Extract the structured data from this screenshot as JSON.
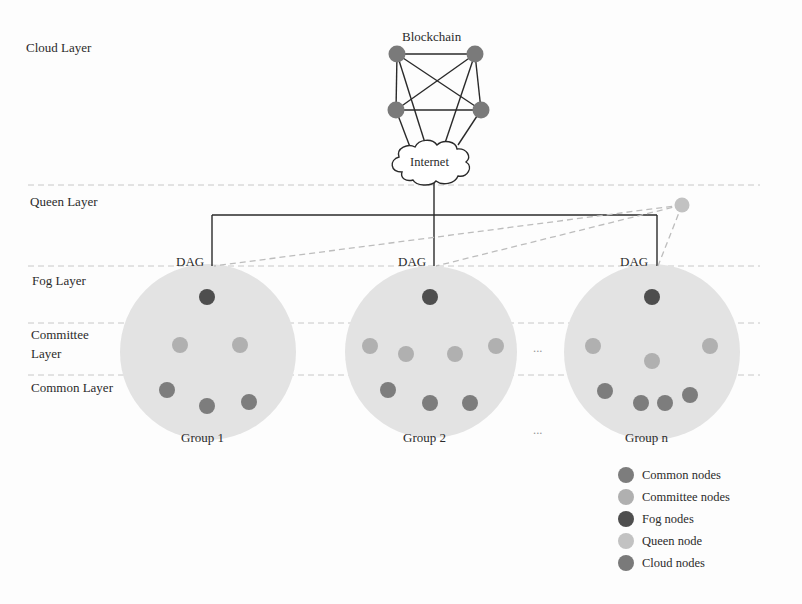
{
  "layers": {
    "cloud": "Cloud Layer",
    "queen": "Queen Layer",
    "fog": "Fog Layer",
    "committee_line1": "Committee",
    "committee_line2": "Layer",
    "common": "Common Layer"
  },
  "cloud": {
    "blockchain_label": "Blockchain",
    "internet_label": "Internet"
  },
  "dag_label": "DAG",
  "groups": [
    {
      "label": "Group 1"
    },
    {
      "label": "Group 2"
    },
    {
      "label": "Group n"
    }
  ],
  "ellipsis": "...",
  "legend": [
    {
      "label": "Common nodes",
      "color": "#7d7d7d"
    },
    {
      "label": "Committee nodes",
      "color": "#b0b0b0"
    },
    {
      "label": "Fog nodes",
      "color": "#4e4e4e"
    },
    {
      "label": "Queen node",
      "color": "#c2c2c2"
    },
    {
      "label": "Cloud nodes",
      "color": "#7a7a7a"
    }
  ],
  "colors": {
    "group_fill": "#e3e3e3",
    "common": "#7d7d7d",
    "committee": "#b0b0b0",
    "fog": "#4e4e4e",
    "queen": "#c2c2c2",
    "cloud": "#7a7a7a",
    "line": "#2a2a2a",
    "dashed": "#bdbdbd"
  }
}
